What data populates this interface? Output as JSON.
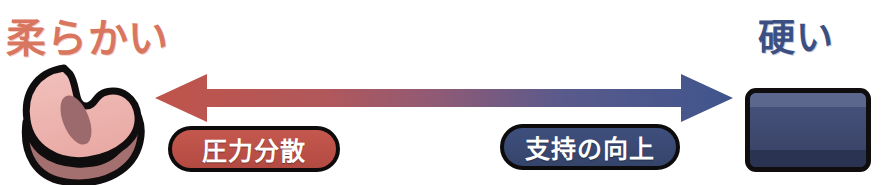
{
  "diagram": {
    "type": "spectrum-scale",
    "orientation": "horizontal",
    "left_end": {
      "label": "柔らかい",
      "label_color": "#d9765f",
      "icon_name": "soft-bean-cushion",
      "icon_fill": "#eeb5b0",
      "icon_shadow": "#a3706f",
      "icon_outline": "#100d0e"
    },
    "right_end": {
      "label": "硬い",
      "label_color": "#3c4f83",
      "icon_name": "hard-block",
      "icon_fill": "#3a4668",
      "icon_band_top": "#5b678c",
      "icon_band_bottom": "#2b3352",
      "icon_outline": "#100d0e"
    },
    "arrow": {
      "name": "double-headed-gradient-arrow",
      "direction": "bidirectional",
      "start_color": "#c0544a",
      "end_color": "#3f558c"
    },
    "badges": [
      {
        "id": "pressure-dispersion",
        "label": "圧力分散",
        "color": "#c4584f",
        "text_color": "#ffffff",
        "side": "left"
      },
      {
        "id": "support-improvement",
        "label": "支持の向上",
        "color": "#3f4f7e",
        "text_color": "#ffffff",
        "side": "right"
      }
    ]
  }
}
